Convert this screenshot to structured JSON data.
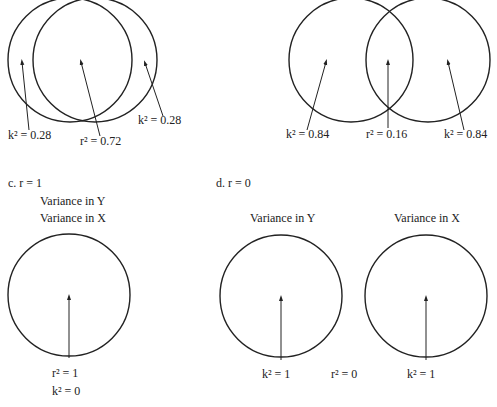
{
  "panels": {
    "a": {
      "left_label": "k² = 0.28",
      "center_label": "r² = 0.72",
      "right_label": "k² = 0.28"
    },
    "b": {
      "left_label": "k² = 0.84",
      "center_label": "r² = 0.16",
      "right_label": "k² = 0.84"
    },
    "c": {
      "title": "c. r = 1",
      "circle_label_y": "Variance in Y",
      "circle_label_x": "Variance in X",
      "label_r": "r² = 1",
      "label_k": "k² = 0"
    },
    "d": {
      "title": "d. r = 0",
      "circle_label_y": "Variance in Y",
      "circle_label_x": "Variance in X",
      "left_label": "k² = 1",
      "center_label": "r² = 0",
      "right_label": "k² = 1"
    }
  }
}
